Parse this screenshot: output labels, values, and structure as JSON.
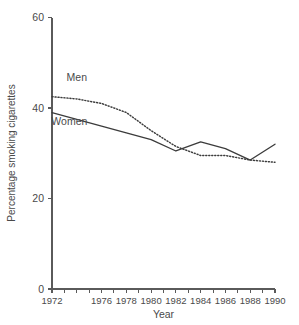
{
  "figure": {
    "clipped_top_title": "",
    "background_color": "#ffffff",
    "ink_color": "#3c3c3c"
  },
  "chart_data": {
    "type": "line",
    "title": "",
    "xlabel": "Year",
    "ylabel": "Percentage smoking cigarettes",
    "x": [
      1972,
      1974,
      1976,
      1978,
      1980,
      1982,
      1984,
      1986,
      1988,
      1990
    ],
    "xlim": [
      1972,
      1990
    ],
    "ylim": [
      0,
      60
    ],
    "yticks": [
      0,
      20,
      40,
      60
    ],
    "ytick_labels": [
      "0",
      "20",
      "40",
      "60"
    ],
    "xticks": [
      1972,
      1973,
      1974,
      1975,
      1976,
      1977,
      1978,
      1979,
      1980,
      1981,
      1982,
      1983,
      1984,
      1985,
      1986,
      1987,
      1988,
      1989,
      1990
    ],
    "xtick_labels_shown": [
      "1972",
      "1976",
      "1978",
      "1980",
      "1982",
      "1984",
      "1986",
      "1988",
      "1990"
    ],
    "grid": false,
    "legend_position": "inline-annotations",
    "series": [
      {
        "name": "Men",
        "style": "dotted",
        "color": "#3c3c3c",
        "label_annotation": "Men",
        "values": [
          42.5,
          42.0,
          41.0,
          39.0,
          35.0,
          31.5,
          29.5,
          29.5,
          28.5,
          28.0
        ]
      },
      {
        "name": "Women",
        "style": "solid",
        "color": "#3c3c3c",
        "label_annotation": "Women",
        "values": [
          39.0,
          37.5,
          36.0,
          34.5,
          33.0,
          30.5,
          32.5,
          31.0,
          28.5,
          32.0
        ]
      }
    ],
    "annotations": [
      {
        "text": "Men",
        "x": 1974.0,
        "y": 46.0
      },
      {
        "text": "Women",
        "x": 1973.4,
        "y": 36.2
      }
    ]
  }
}
